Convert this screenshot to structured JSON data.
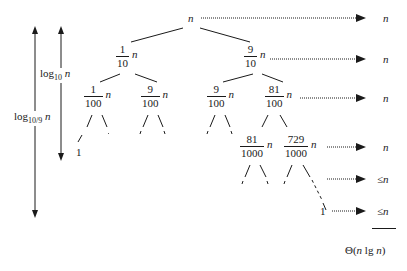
{
  "diagram": {
    "type": "recursion-tree",
    "root": {
      "label": "n"
    },
    "level1": [
      {
        "num": "1",
        "den": "10",
        "var": "n"
      },
      {
        "num": "9",
        "den": "10",
        "var": "n"
      }
    ],
    "level2": [
      {
        "num": "1",
        "den": "100",
        "var": "n"
      },
      {
        "num": "9",
        "den": "100",
        "var": "n"
      },
      {
        "num": "9",
        "den": "100",
        "var": "n"
      },
      {
        "num": "81",
        "den": "100",
        "var": "n"
      }
    ],
    "level3": [
      {
        "num": "81",
        "den": "1000",
        "var": "n"
      },
      {
        "num": "729",
        "den": "1000",
        "var": "n"
      }
    ],
    "leaf_left": "1",
    "leaf_right": "1",
    "height_arrows": {
      "inner": {
        "base": "log",
        "sub": "10",
        "var": "n"
      },
      "outer": {
        "base": "log",
        "sub": "10/9",
        "var": "n"
      }
    },
    "level_costs": [
      "n",
      "n",
      "n",
      "n",
      "≤n",
      "≤n"
    ],
    "total": "Θ(n lg n)"
  }
}
